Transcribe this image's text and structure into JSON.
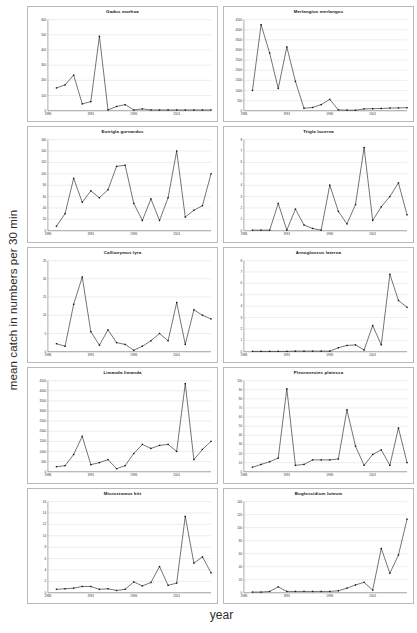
{
  "figure": {
    "ylabel": "mean catch in numbers per 30 min",
    "xlabel": "year"
  },
  "chart_data": [
    {
      "type": "line",
      "title": "Gadus morhua",
      "xlabel": "year",
      "ylabel": "mean catch in numbers per 30 min",
      "xlim": [
        1986,
        2005
      ],
      "ylim": [
        0,
        600
      ],
      "yticks": [
        0,
        100,
        200,
        300,
        400,
        500,
        600
      ],
      "xticks": [
        1986,
        1991,
        1996,
        2001
      ],
      "grid": true,
      "x": [
        1987,
        1988,
        1989,
        1990,
        1991,
        1992,
        1993,
        1994,
        1995,
        1996,
        1997,
        1998,
        1999,
        2000,
        2001,
        2002,
        2003,
        2004,
        2005
      ],
      "values": [
        150,
        170,
        235,
        45,
        60,
        490,
        5,
        28,
        40,
        5,
        12,
        5,
        5,
        5,
        5,
        5,
        5,
        5,
        5
      ]
    },
    {
      "type": "line",
      "title": "Merlangius merlangus",
      "xlabel": "year",
      "ylabel": "mean catch in numbers per 30 min",
      "xlim": [
        1986,
        2005
      ],
      "ylim": [
        0,
        4500
      ],
      "yticks": [
        0,
        500,
        1000,
        1500,
        2000,
        2500,
        3000,
        3500,
        4000,
        4500
      ],
      "xticks": [
        1986,
        1991,
        1996,
        2001
      ],
      "grid": true,
      "x": [
        1987,
        1988,
        1989,
        1990,
        1991,
        1992,
        1993,
        1994,
        1995,
        1996,
        1997,
        1998,
        1999,
        2000,
        2001,
        2002,
        2003,
        2004,
        2005
      ],
      "values": [
        1000,
        4250,
        2850,
        1100,
        3150,
        1450,
        120,
        160,
        300,
        560,
        40,
        30,
        25,
        90,
        100,
        110,
        130,
        140,
        150
      ]
    },
    {
      "type": "line",
      "title": "Eutrigla gurnardus",
      "xlabel": "year",
      "ylabel": "mean catch in numbers per 30 min",
      "xlim": [
        1986,
        2005
      ],
      "ylim": [
        0,
        160
      ],
      "yticks": [
        0,
        20,
        40,
        60,
        80,
        100,
        120,
        140,
        160
      ],
      "xticks": [
        1986,
        1991,
        1996,
        2001
      ],
      "grid": true,
      "x": [
        1987,
        1988,
        1989,
        1990,
        1991,
        1992,
        1993,
        1994,
        1995,
        1996,
        1997,
        1998,
        1999,
        2000,
        2001,
        2002,
        2003,
        2004,
        2005
      ],
      "values": [
        8,
        30,
        92,
        50,
        70,
        58,
        72,
        113,
        115,
        48,
        18,
        56,
        18,
        58,
        140,
        24,
        36,
        44,
        100
      ]
    },
    {
      "type": "line",
      "title": "Trigla lucerna",
      "xlabel": "year",
      "ylabel": "mean catch in numbers per 30 min",
      "xlim": [
        1986,
        2005
      ],
      "ylim": [
        0,
        8
      ],
      "yticks": [
        0,
        1,
        2,
        3,
        4,
        5,
        6,
        7,
        8
      ],
      "xticks": [
        1986,
        1991,
        1996,
        2001
      ],
      "grid": true,
      "x": [
        1987,
        1988,
        1989,
        1990,
        1991,
        1992,
        1993,
        1994,
        1995,
        1996,
        1997,
        1998,
        1999,
        2000,
        2001,
        2002,
        2003,
        2004,
        2005
      ],
      "values": [
        0.05,
        0.05,
        0.05,
        2.4,
        0.05,
        1.9,
        0.5,
        0.2,
        0.05,
        4.0,
        1.7,
        0.6,
        2.3,
        7.3,
        0.9,
        2.1,
        3.0,
        4.2,
        1.4
      ]
    },
    {
      "type": "line",
      "title": "Callionymus lyra",
      "xlabel": "year",
      "ylabel": "mean catch in numbers per 30 min",
      "xlim": [
        1986,
        2005
      ],
      "ylim": [
        0,
        25
      ],
      "yticks": [
        0,
        5,
        10,
        15,
        20,
        25
      ],
      "xticks": [
        1986,
        1991,
        1996,
        2001
      ],
      "grid": true,
      "x": [
        1987,
        1988,
        1989,
        1990,
        1991,
        1992,
        1993,
        1994,
        1995,
        1996,
        1997,
        1998,
        1999,
        2000,
        2001,
        2002,
        2003,
        2004,
        2005
      ],
      "values": [
        2.2,
        1.5,
        13,
        20.5,
        5.5,
        1.8,
        6,
        2.5,
        2,
        0.4,
        1.5,
        3,
        5,
        3,
        13.5,
        2,
        11.5,
        10,
        9
      ]
    },
    {
      "type": "line",
      "title": "Arnoglossus laterna",
      "xlabel": "year",
      "ylabel": "mean catch in numbers per 30 min",
      "xlim": [
        1986,
        2005
      ],
      "ylim": [
        0,
        8
      ],
      "yticks": [
        0,
        1,
        2,
        3,
        4,
        5,
        6,
        7,
        8
      ],
      "xticks": [
        1986,
        1991,
        1996,
        2001
      ],
      "grid": true,
      "x": [
        1987,
        1988,
        1989,
        1990,
        1991,
        1992,
        1993,
        1994,
        1995,
        1996,
        1997,
        1998,
        1999,
        2000,
        2001,
        2002,
        2003,
        2004,
        2005
      ],
      "values": [
        0.03,
        0.03,
        0.03,
        0.03,
        0.03,
        0.05,
        0.05,
        0.05,
        0.05,
        0.05,
        0.35,
        0.55,
        0.6,
        0.15,
        2.3,
        0.6,
        6.8,
        4.5,
        3.9
      ]
    },
    {
      "type": "line",
      "title": "Limanda limanda",
      "xlabel": "year",
      "ylabel": "mean catch in numbers per 30 min",
      "xlim": [
        1986,
        2005
      ],
      "ylim": [
        0,
        4500
      ],
      "yticks": [
        0,
        500,
        1000,
        1500,
        2000,
        2500,
        3000,
        3500,
        4000,
        4500
      ],
      "xticks": [
        1986,
        1991,
        1996,
        2001
      ],
      "grid": true,
      "x": [
        1987,
        1988,
        1989,
        1990,
        1991,
        1992,
        1993,
        1994,
        1995,
        1996,
        1997,
        1998,
        1999,
        2000,
        2001,
        2002,
        2003,
        2004,
        2005
      ],
      "values": [
        250,
        300,
        850,
        1750,
        350,
        450,
        600,
        150,
        300,
        900,
        1350,
        1150,
        1300,
        1350,
        1000,
        4350,
        600,
        1100,
        1500,
        550
      ]
    },
    {
      "type": "line",
      "title": "Pleuronectes platessa",
      "xlabel": "year",
      "ylabel": "mean catch in numbers per 30 min",
      "xlim": [
        1986,
        2005
      ],
      "ylim": [
        0,
        100
      ],
      "yticks": [
        0,
        10,
        20,
        30,
        40,
        50,
        60,
        70,
        80,
        90,
        100
      ],
      "xticks": [
        1986,
        1991,
        1996,
        2001
      ],
      "grid": true,
      "x": [
        1987,
        1988,
        1989,
        1990,
        1991,
        1992,
        1993,
        1994,
        1995,
        1996,
        1997,
        1998,
        1999,
        2000,
        2001,
        2002,
        2003,
        2004,
        2005
      ],
      "values": [
        5,
        8,
        11,
        15,
        91,
        7,
        8,
        13,
        13,
        13,
        14,
        68,
        28,
        7,
        19,
        24,
        7,
        48,
        10,
        18
      ]
    },
    {
      "type": "line",
      "title": "Microstomus kitt",
      "xlabel": "year",
      "ylabel": "mean catch in numbers per 30 min",
      "xlim": [
        1986,
        2005
      ],
      "ylim": [
        0,
        16
      ],
      "yticks": [
        0,
        2,
        4,
        6,
        8,
        10,
        12,
        14,
        16
      ],
      "xticks": [
        1986,
        1991,
        1996,
        2001
      ],
      "grid": true,
      "x": [
        1987,
        1988,
        1989,
        1990,
        1991,
        1992,
        1993,
        1994,
        1995,
        1996,
        1997,
        1998,
        1999,
        2000,
        2001,
        2002,
        2003,
        2004,
        2005
      ],
      "values": [
        0.6,
        0.7,
        0.8,
        1.1,
        1.1,
        0.6,
        0.7,
        0.4,
        0.6,
        1.9,
        1.2,
        1.8,
        4.6,
        1.3,
        1.7,
        13.4,
        5.2,
        6.3,
        3.5,
        15.6
      ]
    },
    {
      "type": "line",
      "title": "Buglossidium luteum",
      "xlabel": "year",
      "ylabel": "mean catch in numbers per 30 min",
      "xlim": [
        1986,
        2005
      ],
      "ylim": [
        0,
        140
      ],
      "yticks": [
        0,
        20,
        40,
        60,
        80,
        100,
        120,
        140
      ],
      "xticks": [
        1986,
        1991,
        1996,
        2001
      ],
      "grid": true,
      "x": [
        1987,
        1988,
        1989,
        1990,
        1991,
        1992,
        1993,
        1994,
        1995,
        1996,
        1997,
        1998,
        1999,
        2000,
        2001,
        2002,
        2003,
        2004,
        2005
      ],
      "values": [
        1,
        1,
        2,
        9,
        2,
        2,
        2,
        2,
        2,
        2,
        3,
        7,
        12,
        16,
        4,
        68,
        30,
        58,
        113,
        17,
        40
      ]
    }
  ]
}
